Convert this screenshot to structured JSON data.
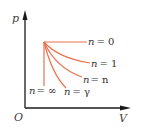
{
  "diagram": {
    "type": "p-V polytropic processes",
    "axes": {
      "y_label": "p",
      "x_label": "V",
      "origin_label": "O"
    },
    "colors": {
      "axis": "#1a1a1a",
      "curve": "#e8734f",
      "text": "#333333"
    },
    "curves": [
      {
        "n": "0",
        "label_var": "n",
        "label_eq": "= 0",
        "description": "isobaric (horizontal)"
      },
      {
        "n": "1",
        "label_var": "n",
        "label_eq": "= 1",
        "description": "isothermal"
      },
      {
        "n": "n",
        "label_var": "n",
        "label_eq": "= n",
        "description": "general polytropic"
      },
      {
        "n": "γ",
        "label_var": "n",
        "label_eq": "= γ",
        "description": "adiabatic"
      },
      {
        "n": "∞",
        "label_var": "n",
        "label_eq": "= ∞",
        "description": "isochoric (vertical)"
      }
    ]
  }
}
